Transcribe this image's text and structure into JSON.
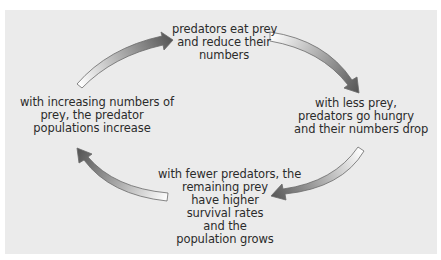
{
  "diagram": {
    "type": "cycle",
    "background_color": "#ebebeb",
    "arrow_gradient": {
      "tail": "#ffffff",
      "head": "#555555"
    },
    "nodes": [
      {
        "id": "top",
        "lines": [
          "predators eat prey",
          "and reduce their",
          "numbers"
        ]
      },
      {
        "id": "right",
        "lines": [
          "with less prey,",
          "predators go hungry",
          "and their numbers drop"
        ]
      },
      {
        "id": "bottom",
        "lines": [
          "with fewer predators, the",
          "remaining prey",
          "have higher",
          "survival rates",
          "and the",
          "population grows"
        ]
      },
      {
        "id": "left",
        "lines": [
          "with increasing numbers of",
          "prey, the predator",
          "populations increase"
        ]
      }
    ],
    "arrows": [
      {
        "from": "left",
        "to": "top",
        "direction": "clockwise"
      },
      {
        "from": "top",
        "to": "right",
        "direction": "clockwise"
      },
      {
        "from": "right",
        "to": "bottom",
        "direction": "clockwise"
      },
      {
        "from": "bottom",
        "to": "left",
        "direction": "clockwise"
      }
    ]
  }
}
